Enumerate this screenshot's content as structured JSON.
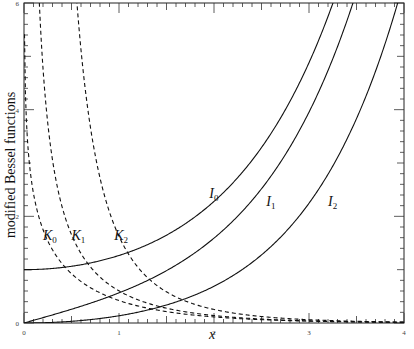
{
  "chart_data": {
    "type": "line",
    "title": "",
    "xlabel": "x",
    "ylabel": "modified Bessel functions",
    "xlim": [
      0,
      4
    ],
    "ylim": [
      0,
      6
    ],
    "x_ticks": [
      0,
      1,
      2,
      3,
      4
    ],
    "y_ticks": [
      0,
      2,
      4,
      6
    ],
    "x_tick_labels": [
      "0",
      "1",
      "2",
      "3",
      "4"
    ],
    "y_tick_labels": [
      "0",
      "2",
      "4",
      "6"
    ],
    "grid": false,
    "legend": "inline labels",
    "series": [
      {
        "name": "I0",
        "label_main": "I",
        "label_sub": "0",
        "style": "solid",
        "func": "I",
        "order": 0,
        "sample": {
          "x": [
            0,
            1,
            2,
            3,
            3.3
          ],
          "y": [
            1.0,
            1.266,
            2.28,
            4.881,
            6.0
          ]
        },
        "label_pos": [
          1.95,
          2.35
        ]
      },
      {
        "name": "I1",
        "label_main": "I",
        "label_sub": "1",
        "style": "solid",
        "func": "I",
        "order": 1,
        "sample": {
          "x": [
            0,
            1,
            2,
            3,
            3.65
          ],
          "y": [
            0.0,
            0.565,
            1.591,
            3.953,
            6.0
          ]
        },
        "label_pos": [
          2.55,
          2.2
        ]
      },
      {
        "name": "I2",
        "label_main": "I",
        "label_sub": "2",
        "style": "solid",
        "func": "I",
        "order": 2,
        "sample": {
          "x": [
            0,
            1,
            2,
            3,
            4
          ],
          "y": [
            0.0,
            0.136,
            0.689,
            2.245,
            6.42
          ]
        },
        "label_pos": [
          3.2,
          2.2
        ]
      },
      {
        "name": "K0",
        "label_main": "K",
        "label_sub": "0",
        "style": "dashed",
        "func": "K",
        "order": 0,
        "sample": {
          "x": [
            0.05,
            0.5,
            1,
            2,
            3,
            4
          ],
          "y": [
            3.114,
            0.924,
            0.421,
            0.114,
            0.035,
            0.011
          ]
        },
        "label_pos": [
          0.2,
          1.55
        ]
      },
      {
        "name": "K1",
        "label_main": "K",
        "label_sub": "1",
        "style": "dashed",
        "func": "K",
        "order": 1,
        "sample": {
          "x": [
            0.17,
            0.5,
            1,
            2,
            3,
            4
          ],
          "y": [
            5.85,
            1.656,
            0.602,
            0.14,
            0.04,
            0.012
          ]
        },
        "label_pos": [
          0.5,
          1.55
        ]
      },
      {
        "name": "K2",
        "label_main": "K",
        "label_sub": "2",
        "style": "dashed",
        "func": "K",
        "order": 2,
        "sample": {
          "x": [
            0.57,
            1,
            2,
            3,
            4
          ],
          "y": [
            6.0,
            1.625,
            0.254,
            0.062,
            0.017
          ]
        },
        "label_pos": [
          0.95,
          1.55
        ]
      }
    ]
  },
  "axes": {
    "xlabel": "x",
    "ylabel": "modified Bessel functions"
  }
}
